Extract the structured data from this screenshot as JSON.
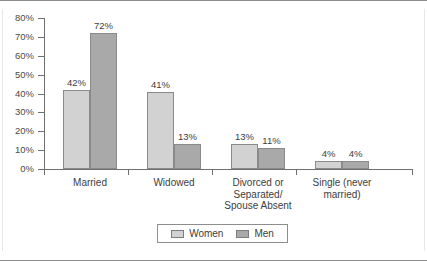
{
  "chart_data": {
    "type": "bar",
    "title": "",
    "subtitle": "",
    "xlabel": "",
    "ylabel": "",
    "ylim": [
      0,
      80
    ],
    "ytick_labels": [
      "80%",
      "70%",
      "60%",
      "50%",
      "40%",
      "30%",
      "20%",
      "10%",
      "0%"
    ],
    "ytick_values": [
      80,
      70,
      60,
      50,
      40,
      30,
      20,
      10,
      0
    ],
    "grid": false,
    "legend_position": "bottom-center",
    "categories": [
      "Married",
      "Widowed",
      "Divorced or Separated/ Spouse Absent",
      "Single (never married)"
    ],
    "category_label_lines": [
      [
        "Married"
      ],
      [
        "Widowed"
      ],
      [
        "Divorced or",
        "Separated/",
        "Spouse Absent"
      ],
      [
        "Single (never",
        "married)"
      ]
    ],
    "series": [
      {
        "name": "Women",
        "color": "#d2d2d2",
        "values": [
          42,
          41,
          13,
          4
        ],
        "data_labels": [
          "42%",
          "41%",
          "13%",
          "4%"
        ]
      },
      {
        "name": "Men",
        "color": "#a9a9a9",
        "values": [
          72,
          13,
          11,
          4
        ],
        "data_labels": [
          "72%",
          "13%",
          "11%",
          "4%"
        ]
      }
    ]
  },
  "legend": {
    "items": [
      {
        "label": "Women",
        "swatch": "women-swatch"
      },
      {
        "label": "Men",
        "swatch": "men-swatch"
      }
    ]
  }
}
